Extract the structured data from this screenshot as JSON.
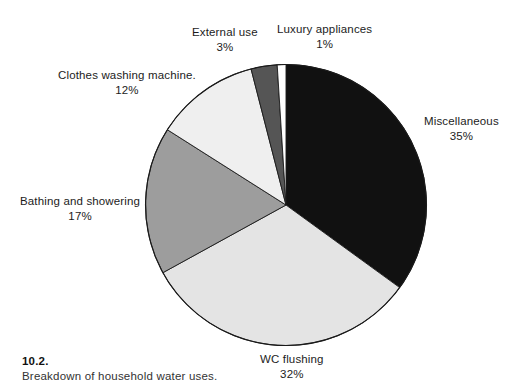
{
  "chart_data": {
    "type": "pie",
    "title": "Breakdown of household water uses.",
    "figure_number": "10.2.",
    "units": "percent",
    "start_angle_deg": 0,
    "direction": "clockwise",
    "legend": "none (direct labels with leader-free callouts)",
    "labels": [
      "Miscellaneous",
      "WC flushing",
      "Bathing and showering",
      "Clothes washing machine.",
      "External use",
      "Luxury appliances"
    ],
    "values": [
      35,
      32,
      17,
      12,
      3,
      1
    ],
    "value_labels": [
      "35%",
      "32%",
      "17%",
      "12%",
      "3%",
      "1%"
    ],
    "colors": [
      "#111111",
      "#e4e4e4",
      "#9d9d9d",
      "#efefef",
      "#555555",
      "#ffffff"
    ],
    "slices": [
      {
        "name": "Miscellaneous",
        "value": 35,
        "value_label": "35%",
        "color": "#111111"
      },
      {
        "name": "WC flushing",
        "value": 32,
        "value_label": "32%",
        "color": "#e4e4e4"
      },
      {
        "name": "Bathing and showering",
        "value": 17,
        "value_label": "17%",
        "color": "#9d9d9d"
      },
      {
        "name": "Clothes washing machine.",
        "value": 12,
        "value_label": "12%",
        "color": "#efefef"
      },
      {
        "name": "External use",
        "value": 3,
        "value_label": "3%",
        "color": "#555555"
      },
      {
        "name": "Luxury appliances",
        "value": 1,
        "value_label": "1%",
        "color": "#ffffff"
      }
    ]
  },
  "caption": {
    "number": "10.2.",
    "text": "Breakdown of household water uses."
  },
  "colors": {
    "background": "#ffffff",
    "outline": "#1a1a1a",
    "text": "#1c1c1c"
  }
}
